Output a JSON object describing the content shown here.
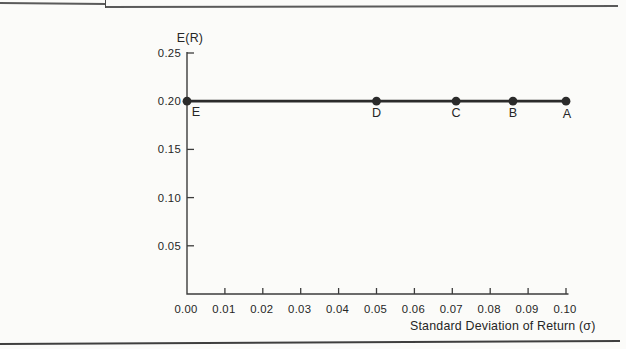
{
  "page": {
    "colors": {
      "background": "#fbfbf9",
      "ink": "#2b2b2b",
      "axis": "#3c3c3c",
      "text": "#262626",
      "top_rule": "#5a5a5a",
      "bottom_rule": "#3f3f3f"
    }
  },
  "chart_data": {
    "type": "scatter",
    "title": "",
    "ylabel": "E(R)",
    "xlabel": "Standard Deviation of Return (σ)",
    "xlim": [
      0,
      0.1
    ],
    "ylim": [
      0,
      0.25
    ],
    "grid": false,
    "legend": null,
    "x_ticks": [
      0.0,
      0.01,
      0.02,
      0.03,
      0.04,
      0.05,
      0.06,
      0.07,
      0.08,
      0.09,
      0.1
    ],
    "x_tick_labels": [
      "0.00",
      "0.01",
      "0.02",
      "0.03",
      "0.04",
      "0.05",
      "0.06",
      "0.07",
      "0.08",
      "0.09",
      "0.10"
    ],
    "y_ticks": [
      0.05,
      0.1,
      0.15,
      0.2,
      0.25
    ],
    "y_tick_labels": [
      "0.05",
      "0.10",
      "0.15",
      "0.20",
      "0.25"
    ],
    "points": [
      {
        "label": "E",
        "x": 0.0,
        "y": 0.2,
        "label_dx": 9,
        "label_dy": 15
      },
      {
        "label": "D",
        "x": 0.05,
        "y": 0.2,
        "label_dx": 0,
        "label_dy": 16
      },
      {
        "label": "C",
        "x": 0.071,
        "y": 0.2,
        "label_dx": 0,
        "label_dy": 16
      },
      {
        "label": "B",
        "x": 0.086,
        "y": 0.2,
        "label_dx": 0,
        "label_dy": 16
      },
      {
        "label": "A",
        "x": 0.1,
        "y": 0.2,
        "label_dx": 1,
        "label_dy": 17
      }
    ],
    "line": {
      "connects": [
        "E",
        "D",
        "C",
        "B",
        "A"
      ],
      "value": 0.2
    }
  }
}
